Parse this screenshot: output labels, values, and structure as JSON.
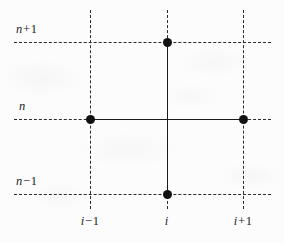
{
  "figure": {
    "background_color": "#fcfcfc",
    "line_color": "#2b2b2b",
    "node_color": "#111111",
    "width": 284,
    "height": 243
  },
  "axes": {
    "y_labels": [
      {
        "id": "n-plus-1",
        "text": "n + 1",
        "var": "n",
        "op": "+",
        "num": "1",
        "y": 42
      },
      {
        "id": "n",
        "text": "n",
        "var": "n",
        "op": "",
        "num": "",
        "y": 119
      },
      {
        "id": "n-minus-1",
        "text": "n − 1",
        "var": "n",
        "op": "−",
        "num": "1",
        "y": 194
      }
    ],
    "x_labels": [
      {
        "id": "i-minus-1",
        "text": "i − 1",
        "var": "i",
        "op": "−",
        "num": "1",
        "x": 90
      },
      {
        "id": "i",
        "text": "i",
        "var": "i",
        "op": "",
        "num": "",
        "x": 167
      },
      {
        "id": "i-plus-1",
        "text": "i + 1",
        "var": "i",
        "op": "+",
        "num": "1",
        "x": 243
      }
    ]
  },
  "grid": {
    "horizontal_dashed": [
      {
        "id": "grid-h-n-plus-1",
        "y": 42,
        "x_start": 14,
        "x_end": 271
      },
      {
        "id": "grid-h-n",
        "y": 119,
        "x_start": 14,
        "x_end": 271
      },
      {
        "id": "grid-h-n-minus-1",
        "y": 194,
        "x_start": 14,
        "x_end": 271
      }
    ],
    "vertical_dashed": [
      {
        "id": "grid-v-i-minus-1",
        "x": 90,
        "y_start": 10,
        "y_end": 209
      },
      {
        "id": "grid-v-i",
        "x": 167,
        "y_start": 10,
        "y_end": 209
      },
      {
        "id": "grid-v-i-plus-1",
        "x": 243,
        "y_start": 10,
        "y_end": 209
      }
    ]
  },
  "stencil": {
    "solid_vertical": {
      "id": "stencil-arm-vertical",
      "x": 167,
      "y_start": 42,
      "y_end": 194
    },
    "solid_horizontal": {
      "id": "stencil-arm-horizontal",
      "y": 119,
      "x_start": 90,
      "x_end": 243
    },
    "nodes": [
      {
        "id": "node-top",
        "label": "(i, n+1)",
        "x": 167,
        "y": 42
      },
      {
        "id": "node-left",
        "label": "(i-1, n)",
        "x": 90,
        "y": 119
      },
      {
        "id": "node-right",
        "label": "(i+1, n)",
        "x": 243,
        "y": 119
      },
      {
        "id": "node-bottom",
        "label": "(i, n-1)",
        "x": 167,
        "y": 194
      }
    ]
  }
}
